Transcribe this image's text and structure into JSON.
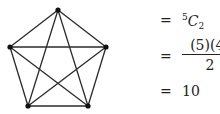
{
  "graph": {
    "name": "complete graph K5",
    "vertices": [
      {
        "id": "top",
        "x": 58,
        "y": 10
      },
      {
        "id": "left",
        "x": 10,
        "y": 47
      },
      {
        "id": "right",
        "x": 106,
        "y": 47
      },
      {
        "id": "bottom-left",
        "x": 28,
        "y": 106
      },
      {
        "id": "bottom-right",
        "x": 88,
        "y": 106
      }
    ],
    "edge_color": "#2a2a2a",
    "vertex_color": "#111111"
  },
  "equations": {
    "eq_sign": "=",
    "line1": {
      "sup": "5",
      "letter": "C",
      "sub": "2"
    },
    "line2": {
      "numerator": "(5)(4)",
      "denominator": "2"
    },
    "line3": {
      "value": "10"
    }
  }
}
